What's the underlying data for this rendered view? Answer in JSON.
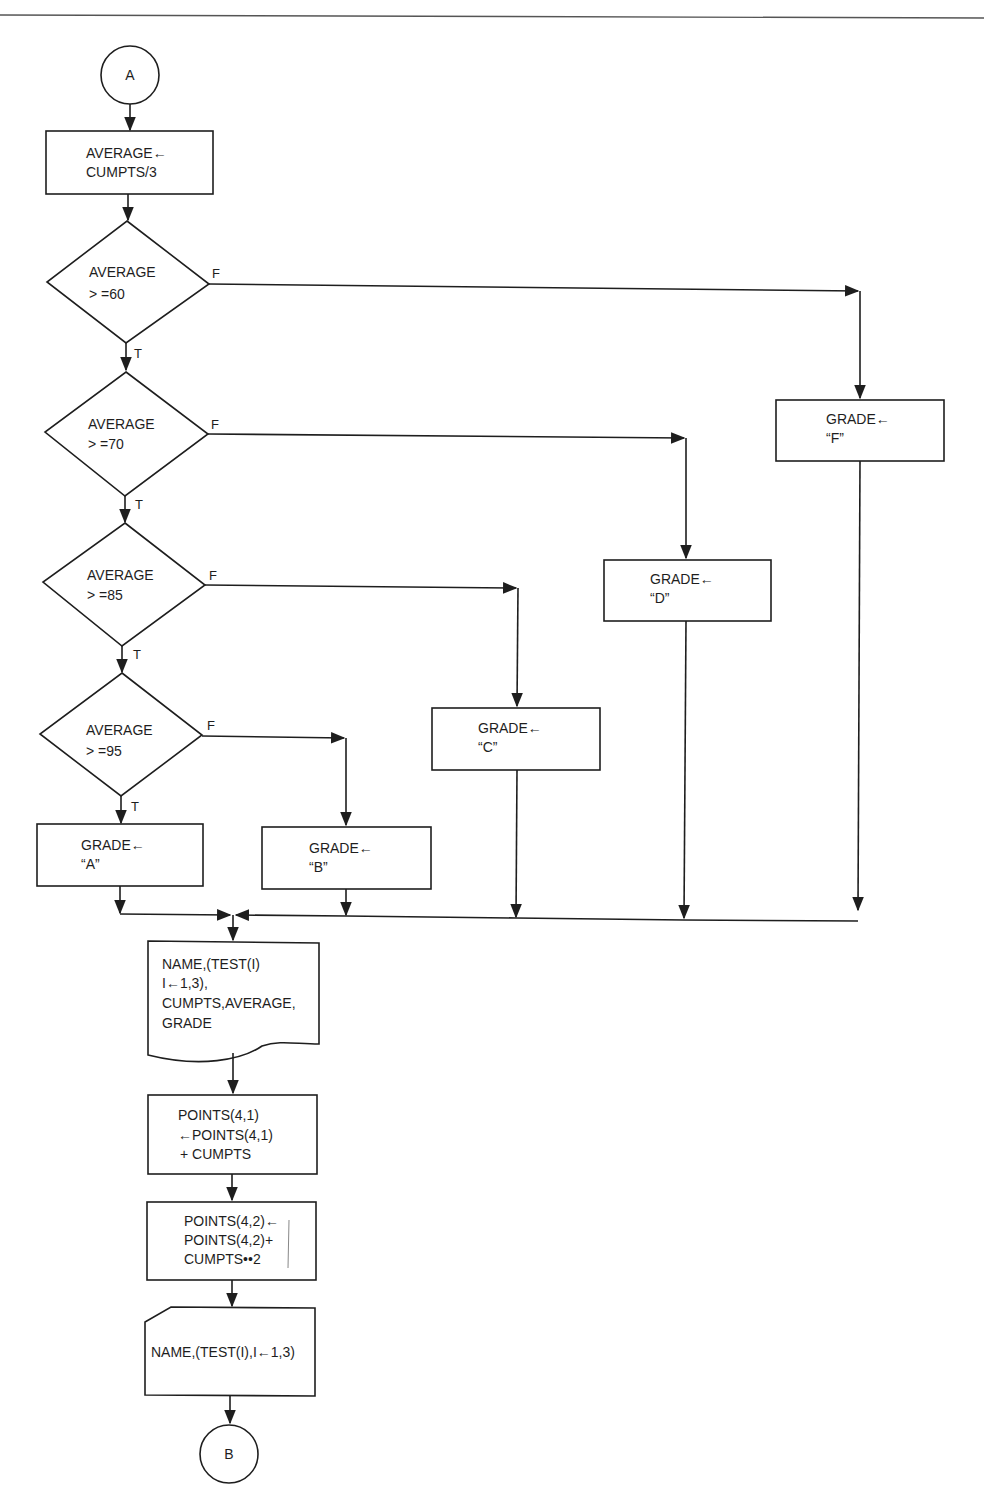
{
  "page": {
    "header_rule": true
  },
  "connectors": {
    "start": "A",
    "end": "B"
  },
  "process_average": {
    "line1": "AVERAGE←",
    "line2": "CUMPTS/3"
  },
  "decisions": [
    {
      "line1": "AVERAGE",
      "line2": "> =60",
      "true_label": "T",
      "false_label": "F"
    },
    {
      "line1": "AVERAGE",
      "line2": "> =70",
      "true_label": "T",
      "false_label": "F"
    },
    {
      "line1": "AVERAGE",
      "line2": "> =85",
      "true_label": "T",
      "false_label": "F"
    },
    {
      "line1": "AVERAGE",
      "line2": "> =95",
      "true_label": "T",
      "false_label": "F"
    }
  ],
  "grade_boxes": {
    "A": {
      "line1": "GRADE←",
      "line2": "“A”"
    },
    "B": {
      "line1": "GRADE←",
      "line2": "“B”"
    },
    "C": {
      "line1": "GRADE←",
      "line2": "“C”"
    },
    "D": {
      "line1": "GRADE←",
      "line2": "“D”"
    },
    "F": {
      "line1": "GRADE←",
      "line2": "“F”"
    }
  },
  "output_document": {
    "line1": "NAME,(TEST(I)",
    "line2": "I←1,3),",
    "line3": "CUMPTS,AVERAGE,",
    "line4": "GRADE"
  },
  "process_points1": {
    "line1": "POINTS(4,1)",
    "line2": "←POINTS(4,1)",
    "line3": "+ CUMPTS"
  },
  "process_points2": {
    "line1": "POINTS(4,2)←",
    "line2": "POINTS(4,2)+",
    "line3": "CUMPTS••2"
  },
  "input_card": {
    "line1": "NAME,(TEST(I),I←1,3)"
  }
}
